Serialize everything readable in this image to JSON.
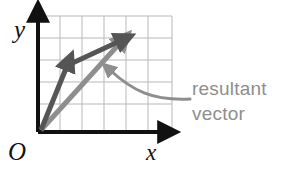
{
  "figure": {
    "kind": "vector-addition-diagram",
    "background": "#ffffff"
  },
  "axes": {
    "origin_label": "O",
    "x_label": "x",
    "y_label": "y",
    "axis_color": "#111111",
    "origin_px": {
      "x": 38,
      "y": 132
    },
    "x_axis_end_px": {
      "x": 170,
      "y": 132
    },
    "y_axis_end_px": {
      "x": 38,
      "y": 12
    }
  },
  "grid": {
    "color": "#b9b9b9",
    "cell_size_px": 22,
    "columns": 6,
    "rows": 5,
    "left_px": 38,
    "top_px": 16,
    "right_px": 172,
    "bottom_px": 132,
    "visible": true
  },
  "vectors": [
    {
      "name": "component-vector-a",
      "color": "#555555",
      "from": {
        "x": 40,
        "y": 131
      },
      "to": {
        "x": 70,
        "y": 60
      },
      "width_px": 5
    },
    {
      "name": "component-vector-b",
      "color": "#555555",
      "from": {
        "x": 66,
        "y": 66
      },
      "to": {
        "x": 124,
        "y": 38
      },
      "width_px": 5
    },
    {
      "name": "resultant-vector",
      "color": "#8e8e8e",
      "from": {
        "x": 40,
        "y": 131
      },
      "to": {
        "x": 124,
        "y": 38
      },
      "width_px": 5
    }
  ],
  "annotation": {
    "line1": "resultant",
    "line2": "vector",
    "color": "#8e8e8e",
    "text_x_px": 192,
    "line1_y_px": 95,
    "line2_y_px": 120,
    "pointer": {
      "name": "curved-callout-arrow",
      "color": "#8e8e8e",
      "start": {
        "x": 190,
        "y": 99
      },
      "control1": {
        "x": 150,
        "y": 100
      },
      "control2": {
        "x": 128,
        "y": 86
      },
      "end": {
        "x": 107,
        "y": 67
      },
      "width_px": 3
    }
  }
}
